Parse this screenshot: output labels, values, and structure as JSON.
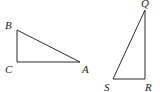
{
  "diagram": {
    "triangles": [
      {
        "name": "ABC",
        "right_angle_at": "C",
        "vertices": {
          "A": {
            "label": "A",
            "x": 80,
            "y": 62,
            "lx": 82,
            "ly": 73
          },
          "B": {
            "label": "B",
            "x": 17,
            "y": 30,
            "lx": 5,
            "ly": 29
          },
          "C": {
            "label": "C",
            "x": 17,
            "y": 62,
            "lx": 5,
            "ly": 73
          }
        }
      },
      {
        "name": "QRS",
        "right_angle_at": "R",
        "vertices": {
          "Q": {
            "label": "Q",
            "x": 145,
            "y": 10,
            "lx": 141,
            "ly": 7
          },
          "R": {
            "label": "R",
            "x": 145,
            "y": 79,
            "lx": 145,
            "ly": 91
          },
          "S": {
            "label": "S",
            "x": 113,
            "y": 79,
            "lx": 104,
            "ly": 91
          }
        }
      }
    ],
    "colors": {
      "stroke": "#2a2a2a",
      "label": "#222222",
      "background": "#ffffff"
    }
  }
}
